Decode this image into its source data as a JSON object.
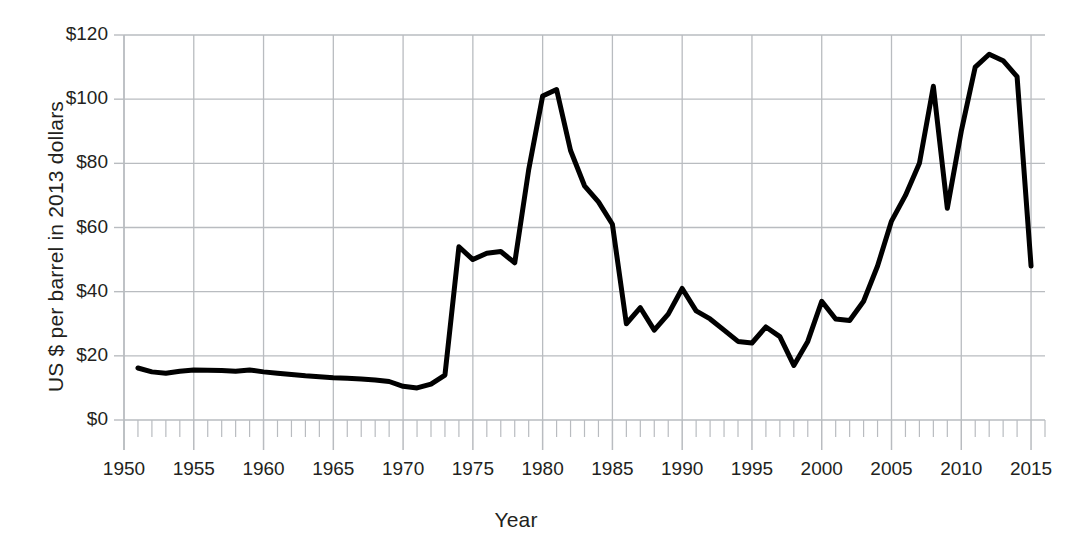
{
  "chart_data": {
    "type": "line",
    "title": "",
    "xlabel": "Year",
    "ylabel": "US $ per barrel in 2013 dollars",
    "xlim": [
      1950,
      2016
    ],
    "ylim": [
      0,
      120
    ],
    "grid": true,
    "legend": null,
    "x_major_ticks": [
      1950,
      1955,
      1960,
      1965,
      1970,
      1975,
      1980,
      1985,
      1990,
      1995,
      2000,
      2005,
      2010,
      2015
    ],
    "x_tick_labels": [
      "1950",
      "1955",
      "1960",
      "1965",
      "1970",
      "1975",
      "1980",
      "1985",
      "1990",
      "1995",
      "2000",
      "2005",
      "2010",
      "2015"
    ],
    "x_minor_tick_step": 1,
    "y_ticks": [
      0,
      20,
      40,
      60,
      80,
      100,
      120
    ],
    "y_tick_labels": [
      "$0",
      "$20",
      "$40",
      "$60",
      "$80",
      "$100",
      "$120"
    ],
    "line_color": "#000000",
    "line_width": 5,
    "grid_color": "#b9bcc0",
    "x": [
      1951,
      1952,
      1953,
      1954,
      1955,
      1956,
      1957,
      1958,
      1959,
      1960,
      1961,
      1962,
      1963,
      1964,
      1965,
      1966,
      1967,
      1968,
      1969,
      1970,
      1971,
      1972,
      1973,
      1974,
      1975,
      1976,
      1977,
      1978,
      1979,
      1980,
      1981,
      1982,
      1983,
      1984,
      1985,
      1986,
      1987,
      1988,
      1989,
      1990,
      1991,
      1992,
      1993,
      1994,
      1995,
      1996,
      1997,
      1998,
      1999,
      2000,
      2001,
      2002,
      2003,
      2004,
      2005,
      2006,
      2007,
      2008,
      2009,
      2010,
      2011,
      2012,
      2013,
      2014,
      2015
    ],
    "y": [
      16.2,
      15.0,
      14.6,
      15.2,
      15.6,
      15.5,
      15.4,
      15.2,
      15.6,
      15.0,
      14.6,
      14.2,
      13.8,
      13.5,
      13.2,
      13.0,
      12.8,
      12.5,
      12.0,
      10.5,
      10.0,
      11.2,
      14.0,
      54.0,
      50.0,
      52.0,
      52.5,
      49.0,
      78.0,
      101.0,
      103.0,
      84.0,
      73.0,
      68.0,
      61.0,
      30.0,
      35.0,
      28.0,
      33.0,
      41.0,
      34.0,
      31.5,
      28.0,
      24.5,
      24.0,
      29.0,
      26.0,
      17.0,
      24.5,
      37.0,
      31.5,
      31.0,
      37.0,
      48.0,
      62.0,
      70.0,
      80.0,
      104.0,
      66.0,
      90.0,
      110.0,
      114.0,
      112.0,
      107.0,
      48.0
    ],
    "annotations": []
  },
  "axis": {
    "y_title": "US $ per barrel in 2013 dollars",
    "x_title": "Year"
  }
}
